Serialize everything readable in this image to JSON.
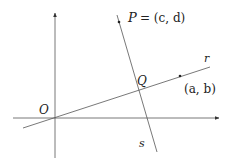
{
  "diagram": {
    "type": "geometry",
    "colors": {
      "line": "#555555",
      "text": "#222222",
      "background": "#ffffff"
    },
    "axes": {
      "origin_label": "O",
      "x_axis": {
        "from": [
          13,
          118
        ],
        "to": [
          219,
          118
        ],
        "arrow": true
      },
      "y_axis": {
        "from": [
          55,
          158
        ],
        "to": [
          55,
          13
        ],
        "arrow": true
      }
    },
    "lines": [
      {
        "id": "r",
        "label": "r",
        "from": [
          23,
          128
        ],
        "to": [
          210,
          67
        ]
      },
      {
        "id": "s",
        "label": "s",
        "from": [
          117,
          15
        ],
        "to": [
          157,
          152
        ]
      }
    ],
    "points": [
      {
        "id": "P",
        "label": "P = (c, d)",
        "pos": [
          119,
          23
        ]
      },
      {
        "id": "ab",
        "label": "(a, b)",
        "pos": [
          180,
          76
        ]
      },
      {
        "id": "Q",
        "label": "Q",
        "pos": [
          138,
          89
        ]
      },
      {
        "id": "O",
        "label": "O",
        "pos": [
          55,
          118
        ]
      }
    ],
    "labels": {
      "P_name": "P",
      "P_eq": "= (c, d)",
      "r": "r",
      "s": "s",
      "Q": "Q",
      "O": "O",
      "ab": "(a, b)"
    }
  }
}
